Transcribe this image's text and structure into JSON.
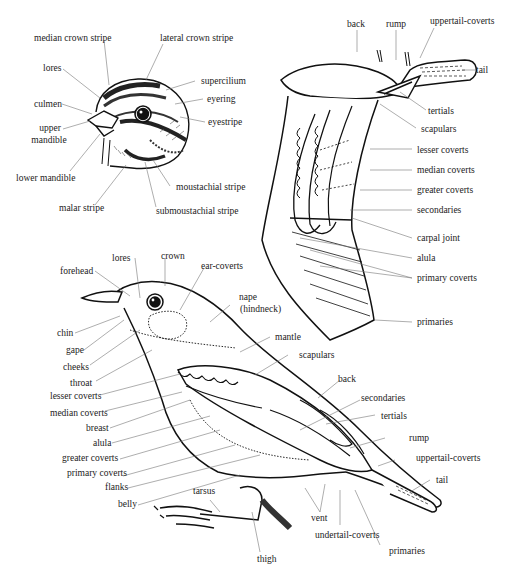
{
  "diagram": {
    "head_detail": {
      "labels": {
        "median_crown_stripe": "median crown stripe",
        "lateral_crown_stripe": "lateral crown stripe",
        "lores": "lores",
        "supercilium": "supercilium",
        "culmen": "culmen",
        "eyering": "eyering",
        "eyestripe": "eyestripe",
        "upper_mandible_1": "upper",
        "upper_mandible_2": "mandible",
        "lower_mandible": "lower mandible",
        "moustachial_stripe": "moustachial stripe",
        "malar_stripe": "malar stripe",
        "submoustachial_stripe": "submoustachial stripe"
      }
    },
    "wing_detail": {
      "labels": {
        "back": "back",
        "rump": "rump",
        "uppertail_coverts": "uppertail-coverts",
        "tail": "tail",
        "tertials": "tertials",
        "scapulars": "scapulars",
        "lesser_coverts": "lesser coverts",
        "median_coverts": "median coverts",
        "greater_coverts": "greater coverts",
        "secondaries": "secondaries",
        "carpal_joint": "carpal joint",
        "alula": "alula",
        "primary_coverts": "primary coverts",
        "primaries": "primaries"
      }
    },
    "body_detail": {
      "labels": {
        "lores": "lores",
        "crown": "crown",
        "forehead": "forehead",
        "ear_coverts": "ear-coverts",
        "nape_1": "nape",
        "nape_2": "(hindneck)",
        "chin": "chin",
        "gape": "gape",
        "cheeks": "cheeks",
        "mantle": "mantle",
        "throat": "throat",
        "scapulars": "scapulars",
        "lesser_coverts": "lesser coverts",
        "median_coverts": "median coverts",
        "back": "back",
        "breast": "breast",
        "secondaries": "secondaries",
        "alula": "alula",
        "tertials": "tertials",
        "greater_coverts": "greater coverts",
        "rump": "rump",
        "primary_coverts": "primary coverts",
        "uppertail_coverts": "uppertail-coverts",
        "flanks": "flanks",
        "tail": "tail",
        "belly": "belly",
        "tarsus": "tarsus",
        "vent": "vent",
        "undertail_coverts": "undertail-coverts",
        "thigh": "thigh",
        "primaries": "primaries"
      }
    }
  }
}
